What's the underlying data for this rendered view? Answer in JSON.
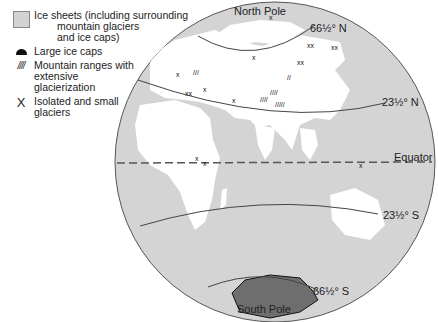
{
  "legend": {
    "items": [
      {
        "symbol": "gray-square",
        "line1": "Ice sheets (including surrounding",
        "line2": "mountain glaciers",
        "line3": "and ice caps)"
      },
      {
        "symbol": "filled-dome",
        "line1": "Large ice caps"
      },
      {
        "symbol": "hatch",
        "glyph": "////",
        "line1": "Mountain ranges with",
        "line2": "extensive",
        "line3": "glacierization"
      },
      {
        "symbol": "x",
        "glyph": "X",
        "line1": "Isolated and small",
        "line2": "glaciers"
      }
    ]
  },
  "labels": {
    "north_pole": "North Pole",
    "south_pole": "South Pole",
    "arctic_circle": "66½° N",
    "tropic_cancer": "23½° N",
    "equator": "Equator",
    "tropic_capricorn": "23½° S",
    "antarctic_circle": "66½° S"
  },
  "colors": {
    "ocean": "#d4d4d4",
    "land": "#ffffff",
    "antarctica": "#6e6e6e",
    "outline": "#555555"
  }
}
